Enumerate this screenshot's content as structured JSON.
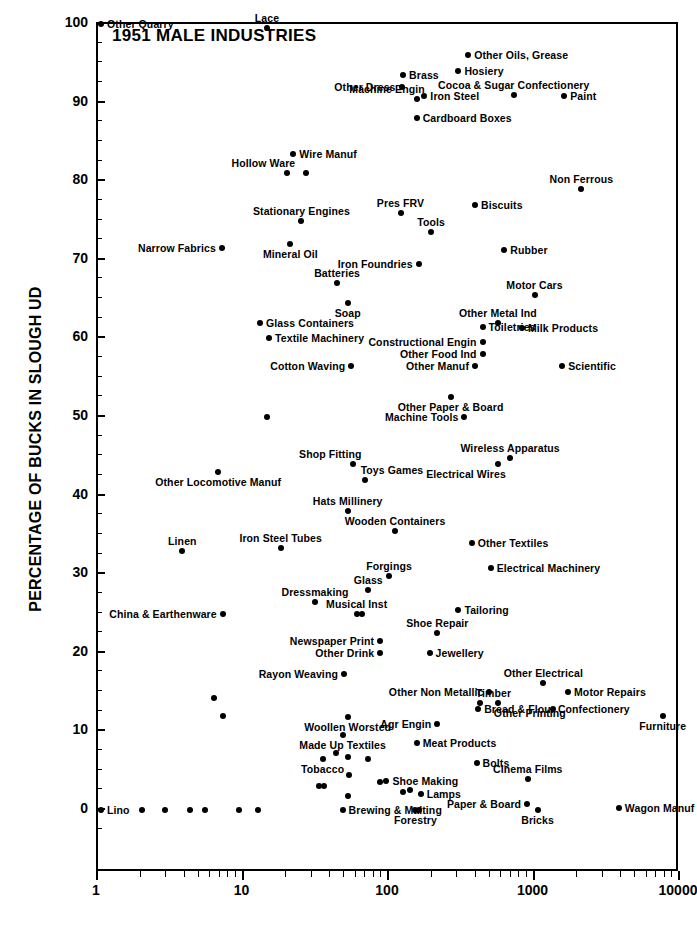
{
  "chart_data": {
    "type": "scatter",
    "title": "1951 MALE INDUSTRIES",
    "xlabel": "",
    "ylabel": "PERCENTAGE OF BUCKS IN SLOUGH UD",
    "xscale": "log",
    "xlim": [
      1,
      10000
    ],
    "ylim": [
      0,
      100
    ],
    "xticks": [
      1,
      10,
      100,
      1000,
      10000
    ],
    "xtick_labels": [
      "1",
      "10",
      "100",
      "1000",
      "10000"
    ],
    "yticks": [
      0,
      10,
      20,
      30,
      40,
      50,
      60,
      70,
      80,
      90,
      100
    ],
    "ytick_labels": [
      "0",
      "10",
      "20",
      "30",
      "40",
      "50",
      "60",
      "70",
      "80",
      "90",
      "100"
    ],
    "ytick_minor_step": 2.5,
    "grid": false,
    "legend": null,
    "marker": "filled-circle",
    "marker_color": "#000000",
    "points": [
      {
        "label": "Other Quarry",
        "x": 1.05,
        "y": 100,
        "side": "r"
      },
      {
        "label": "Lace",
        "x": 14.5,
        "y": 99.5,
        "side": "above"
      },
      {
        "label": "Other Oils, Grease",
        "x": 350,
        "y": 96,
        "side": "r"
      },
      {
        "label": "Brass",
        "x": 125,
        "y": 93.5,
        "side": "r"
      },
      {
        "label": "Hosiery",
        "x": 300,
        "y": 94,
        "side": "r"
      },
      {
        "label": "Other Dress",
        "x": 122,
        "y": 92,
        "side": "l"
      },
      {
        "label": "Cocoa & Sugar Confectionery",
        "x": 720,
        "y": 91,
        "side": "above"
      },
      {
        "label": "Machine Engin",
        "x": 155,
        "y": 90.5,
        "side": "above-l"
      },
      {
        "label": "Iron Steel",
        "x": 175,
        "y": 90.8,
        "side": "r"
      },
      {
        "label": "Paint",
        "x": 1600,
        "y": 90.8,
        "side": "r"
      },
      {
        "label": "Cardboard Boxes",
        "x": 155,
        "y": 88,
        "side": "r"
      },
      {
        "label": "Wire Manuf",
        "x": 22,
        "y": 83.5,
        "side": "r"
      },
      {
        "label": "Hollow Ware",
        "x": 20,
        "y": 81,
        "side": "above-l"
      },
      {
        "label": "",
        "x": 27,
        "y": 81,
        "side": "none"
      },
      {
        "label": "Non Ferrous",
        "x": 2100,
        "y": 79,
        "side": "above"
      },
      {
        "label": "Biscuits",
        "x": 390,
        "y": 77,
        "side": "r"
      },
      {
        "label": "Pres FRV",
        "x": 120,
        "y": 76,
        "side": "above"
      },
      {
        "label": "Stationary Engines",
        "x": 25,
        "y": 75,
        "side": "above"
      },
      {
        "label": "Tools",
        "x": 195,
        "y": 73.5,
        "side": "above"
      },
      {
        "label": "Mineral Oil",
        "x": 21,
        "y": 72,
        "side": "below"
      },
      {
        "label": "Narrow Fabrics",
        "x": 7.1,
        "y": 71.5,
        "side": "l"
      },
      {
        "label": "Rubber",
        "x": 620,
        "y": 71.3,
        "side": "r"
      },
      {
        "label": "Iron Foundries",
        "x": 160,
        "y": 69.5,
        "side": "l"
      },
      {
        "label": "Batteries",
        "x": 44,
        "y": 67,
        "side": "above"
      },
      {
        "label": "Motor Cars",
        "x": 1000,
        "y": 65.5,
        "side": "above"
      },
      {
        "label": "Soap",
        "x": 52,
        "y": 64.5,
        "side": "below"
      },
      {
        "label": "Other Metal Ind",
        "x": 560,
        "y": 62,
        "side": "above"
      },
      {
        "label": "Glass Containers",
        "x": 13,
        "y": 62,
        "side": "r"
      },
      {
        "label": "Toiletries",
        "x": 440,
        "y": 61.5,
        "side": "r"
      },
      {
        "label": "Milk Products",
        "x": 820,
        "y": 61.3,
        "side": "r"
      },
      {
        "label": "Textile Machinery",
        "x": 15,
        "y": 60,
        "side": "r"
      },
      {
        "label": "Constructional Engin",
        "x": 440,
        "y": 59.5,
        "side": "l"
      },
      {
        "label": "Other Food Ind",
        "x": 440,
        "y": 58,
        "side": "l"
      },
      {
        "label": "Cotton Waving",
        "x": 55,
        "y": 56.5,
        "side": "l"
      },
      {
        "label": "Other Manuf",
        "x": 390,
        "y": 56.5,
        "side": "l"
      },
      {
        "label": "Scientific",
        "x": 1550,
        "y": 56.5,
        "side": "r"
      },
      {
        "label": "Other Paper & Board",
        "x": 265,
        "y": 52.5,
        "side": "below"
      },
      {
        "label": "Machine Tools",
        "x": 330,
        "y": 50,
        "side": "l"
      },
      {
        "label": "",
        "x": 14.5,
        "y": 50,
        "side": "none"
      },
      {
        "label": "Wireless Apparatus",
        "x": 680,
        "y": 44.8,
        "side": "above"
      },
      {
        "label": "Shop Fitting",
        "x": 57,
        "y": 44,
        "side": "above-l"
      },
      {
        "label": "Electrical Wires",
        "x": 560,
        "y": 44,
        "side": "below-l"
      },
      {
        "label": "Other Locomotive Manuf",
        "x": 6.7,
        "y": 43,
        "side": "below"
      },
      {
        "label": "Toys Games",
        "x": 68,
        "y": 42,
        "side": "above-r"
      },
      {
        "label": "Hats Millinery",
        "x": 52,
        "y": 38,
        "side": "above"
      },
      {
        "label": "Wooden Containers",
        "x": 110,
        "y": 35.5,
        "side": "above"
      },
      {
        "label": "Other Textiles",
        "x": 370,
        "y": 34,
        "side": "r"
      },
      {
        "label": "Linen",
        "x": 3.8,
        "y": 33,
        "side": "above"
      },
      {
        "label": "Iron Steel Tubes",
        "x": 18,
        "y": 33.3,
        "side": "above"
      },
      {
        "label": "Electrical Machinery",
        "x": 500,
        "y": 30.8,
        "side": "r"
      },
      {
        "label": "Forgings",
        "x": 100,
        "y": 29.8,
        "side": "above"
      },
      {
        "label": "Glass",
        "x": 72,
        "y": 28,
        "side": "above"
      },
      {
        "label": "Dressmaking",
        "x": 31,
        "y": 26.5,
        "side": "above"
      },
      {
        "label": "Tailoring",
        "x": 300,
        "y": 25.5,
        "side": "r"
      },
      {
        "label": "Musical Inst",
        "x": 60,
        "y": 25,
        "side": "above"
      },
      {
        "label": "",
        "x": 65,
        "y": 25,
        "side": "none"
      },
      {
        "label": "China & Earthenware",
        "x": 7.2,
        "y": 25,
        "side": "l"
      },
      {
        "label": "Shoe Repair",
        "x": 215,
        "y": 22.5,
        "side": "above"
      },
      {
        "label": "Newspaper Print",
        "x": 87,
        "y": 21.5,
        "side": "l"
      },
      {
        "label": "Other Drink",
        "x": 87,
        "y": 20,
        "side": "l"
      },
      {
        "label": "Jewellery",
        "x": 190,
        "y": 20,
        "side": "r"
      },
      {
        "label": "Rayon Weaving",
        "x": 49,
        "y": 17.3,
        "side": "l"
      },
      {
        "label": "Other Electrical",
        "x": 1150,
        "y": 16.2,
        "side": "above"
      },
      {
        "label": "Other Non Metallic",
        "x": 490,
        "y": 15,
        "side": "l"
      },
      {
        "label": "Motor Repairs",
        "x": 1700,
        "y": 15,
        "side": "r"
      },
      {
        "label": "",
        "x": 6.3,
        "y": 14.3,
        "side": "none"
      },
      {
        "label": "Timber",
        "x": 420,
        "y": 13.6,
        "side": "above-r"
      },
      {
        "label": "Other Printing",
        "x": 560,
        "y": 13.6,
        "side": "below-r"
      },
      {
        "label": "Bread & Flour Confectionery",
        "x": 410,
        "y": 12.8,
        "side": "r"
      },
      {
        "label": "",
        "x": 1350,
        "y": 12.8,
        "side": "none"
      },
      {
        "label": "Furniture",
        "x": 7600,
        "y": 12,
        "side": "below"
      },
      {
        "label": "",
        "x": 7.2,
        "y": 12,
        "side": "none"
      },
      {
        "label": "Woollen Worsted",
        "x": 52,
        "y": 11.8,
        "side": "below"
      },
      {
        "label": "Agr Engin",
        "x": 215,
        "y": 11,
        "side": "l"
      },
      {
        "label": "Made Up Textiles",
        "x": 48,
        "y": 9.5,
        "side": "below"
      },
      {
        "label": "Meat Products",
        "x": 155,
        "y": 8.5,
        "side": "r"
      },
      {
        "label": "",
        "x": 43,
        "y": 7.3,
        "side": "none"
      },
      {
        "label": "",
        "x": 52,
        "y": 6.8,
        "side": "none"
      },
      {
        "label": "Tobacco",
        "x": 35,
        "y": 6.5,
        "side": "below"
      },
      {
        "label": "",
        "x": 72,
        "y": 6.5,
        "side": "none"
      },
      {
        "label": "Bolts",
        "x": 400,
        "y": 6,
        "side": "r"
      },
      {
        "label": "Cinema Films",
        "x": 900,
        "y": 4,
        "side": "above"
      },
      {
        "label": "",
        "x": 53,
        "y": 4.5,
        "side": "none"
      },
      {
        "label": "Shoe Making",
        "x": 96,
        "y": 3.7,
        "side": "r"
      },
      {
        "label": "",
        "x": 87,
        "y": 3.5,
        "side": "none"
      },
      {
        "label": "",
        "x": 33,
        "y": 3,
        "side": "none"
      },
      {
        "label": "",
        "x": 36,
        "y": 3,
        "side": "none"
      },
      {
        "label": "Lamps",
        "x": 165,
        "y": 2,
        "side": "r"
      },
      {
        "label": "",
        "x": 125,
        "y": 2.3,
        "side": "none"
      },
      {
        "label": "",
        "x": 140,
        "y": 2.5,
        "side": "none"
      },
      {
        "label": "",
        "x": 52,
        "y": 1.8,
        "side": "none"
      },
      {
        "label": "Paper & Board",
        "x": 890,
        "y": 0.7,
        "side": "l"
      },
      {
        "label": "Bricks",
        "x": 1050,
        "y": 0,
        "side": "below"
      },
      {
        "label": "Wagon Manuf",
        "x": 3800,
        "y": 0.3,
        "side": "r"
      },
      {
        "label": "Lino",
        "x": 1.05,
        "y": 0,
        "side": "r"
      },
      {
        "label": "Brewing & Malting",
        "x": 48,
        "y": 0,
        "side": "r"
      },
      {
        "label": "Forestry",
        "x": 152,
        "y": 0,
        "side": "below"
      },
      {
        "label": "",
        "x": 160,
        "y": 0,
        "side": "none"
      },
      {
        "label": "",
        "x": 2.0,
        "y": 0,
        "side": "none"
      },
      {
        "label": "",
        "x": 2.9,
        "y": 0,
        "side": "none"
      },
      {
        "label": "",
        "x": 4.3,
        "y": 0,
        "side": "none"
      },
      {
        "label": "",
        "x": 5.4,
        "y": 0,
        "side": "none"
      },
      {
        "label": "",
        "x": 9.3,
        "y": 0,
        "side": "none"
      },
      {
        "label": "",
        "x": 12.5,
        "y": 0,
        "side": "none"
      }
    ]
  }
}
